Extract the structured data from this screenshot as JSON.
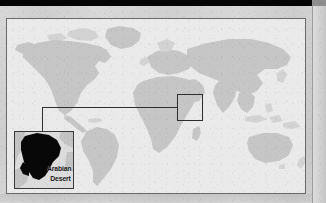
{
  "figure": {
    "kind": "world-locator-map",
    "inset_label_line1": "Arabian",
    "inset_label_line2": "Desert",
    "colors": {
      "paper": "#cfcfcf",
      "ocean": "#eaeaea",
      "land": "#c6c6c6",
      "frame_border": "#6b6b6b",
      "callout_line": "#2e2e2e",
      "inset_border": "#3a3a3a",
      "inset_water": "#dcdcdc",
      "inset_land": "#c3c3c3",
      "target_region_fill": "#080808",
      "top_band": "#050505",
      "label_text": "#101010"
    }
  },
  "map": {
    "projection_note": "equirectangular world map",
    "continents": [
      "North America",
      "South America",
      "Europe",
      "Africa",
      "Asia",
      "Australia",
      "Greenland"
    ],
    "highlight_region": "Arabian Peninsula"
  },
  "inset": {
    "title": "Arabian Desert",
    "highlighted_area": "Arabian Peninsula",
    "surrounding_features": [
      "Red Sea",
      "Persian Gulf",
      "Arabian Sea"
    ]
  }
}
